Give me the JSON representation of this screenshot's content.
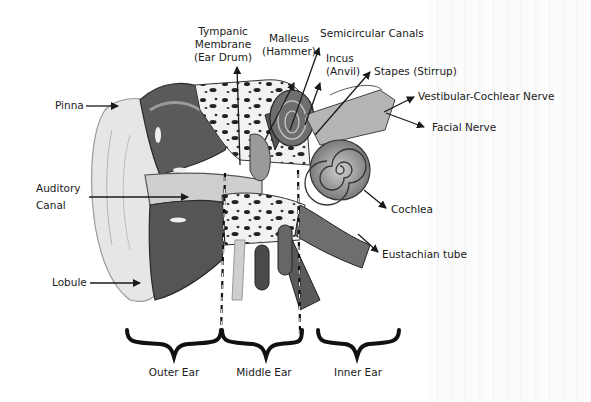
{
  "labels": {
    "pinna": "Pinna",
    "auditory_canal_1": "Auditory",
    "auditory_canal_2": "Canal",
    "lobule": "Lobule",
    "tympanic_1": "Tympanic",
    "tympanic_2": "Membrane",
    "tympanic_3": "(Ear Drum)",
    "malleus_1": "Malleus",
    "malleus_2": "(Hammer)",
    "semicircular": "Semicircular Canals",
    "incus_1": "Incus",
    "incus_2": "(Anvil)",
    "stapes": "Stapes (Stirrup)",
    "vestibular": "Vestibular-Cochlear Nerve",
    "facial": "Facial Nerve",
    "cochlea": "Cochlea",
    "eustachian": "Eustachian tube"
  },
  "sections": {
    "outer": "Outer Ear",
    "middle": "Middle Ear",
    "inner": "Inner Ear"
  },
  "colors": {
    "ink": "#1a1a1a",
    "tissue_dark": "#3c3c3c",
    "tissue_mid": "#8a8a8a",
    "tissue_light": "#d9d9d9",
    "background": "#ffffff"
  }
}
